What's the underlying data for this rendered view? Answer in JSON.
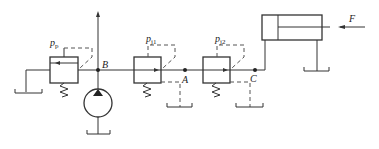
{
  "diagram": {
    "type": "hydraulic-circuit",
    "labels": {
      "relief_valve": "p",
      "relief_valve_sub": "p",
      "reducing_valve_1": "p",
      "reducing_valve_1_sub": "j1",
      "reducing_valve_2": "p",
      "reducing_valve_2_sub": "j2",
      "node_b": "B",
      "node_a": "A",
      "node_c": "C",
      "force": "F"
    },
    "components": [
      {
        "id": "relief-valve",
        "label": "pp"
      },
      {
        "id": "pump"
      },
      {
        "id": "reducing-valve-1",
        "label": "pj1"
      },
      {
        "id": "reducing-valve-2",
        "label": "pj2"
      },
      {
        "id": "cylinder"
      },
      {
        "id": "tanks",
        "count": 5
      }
    ],
    "colors": {
      "line": "#333333",
      "background": "#ffffff"
    }
  }
}
